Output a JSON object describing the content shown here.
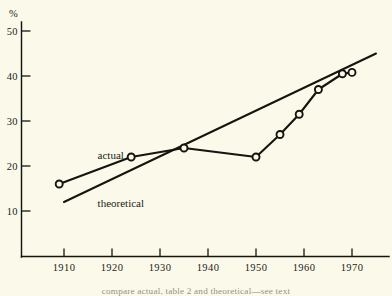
{
  "chart_data": {
    "type": "line",
    "title": "",
    "subtitle": "",
    "xlabel": "",
    "ylabel": "%",
    "xlim": [
      1905,
      1976
    ],
    "ylim": [
      0,
      53
    ],
    "grid": false,
    "legend_position": "inline-annotation",
    "y_ticks": [
      10,
      20,
      30,
      40,
      50
    ],
    "y_tick_labels": [
      "10",
      "20",
      "30",
      "40",
      "50"
    ],
    "x_ticks": [
      1910,
      1920,
      1930,
      1940,
      1950,
      1960,
      1970
    ],
    "x_tick_labels": [
      "1910",
      "1920",
      "1930",
      "1940",
      "1950",
      "1960",
      "1970"
    ],
    "series": [
      {
        "name": "actual",
        "label": "actual",
        "markers": "open-circle",
        "x": [
          1909,
          1924,
          1935,
          1950,
          1955,
          1959,
          1963,
          1968,
          1970
        ],
        "values": [
          16.0,
          22.0,
          24.0,
          22.0,
          27.0,
          31.5,
          37.0,
          40.5,
          40.8
        ]
      },
      {
        "name": "theoretical",
        "label": "theoretical",
        "markers": "none",
        "x": [
          1910,
          1975
        ],
        "values": [
          12.0,
          45.0
        ]
      }
    ],
    "annotations": [
      {
        "text": "actual",
        "x": 1917,
        "y": 21.5
      },
      {
        "text": "theoretical",
        "x": 1917,
        "y": 11.0
      }
    ]
  },
  "caption": {
    "text": "compare actual, table 2 and theoretical—see text"
  },
  "colors": {
    "ink": "#17140f",
    "paper": "#fbfaea"
  }
}
